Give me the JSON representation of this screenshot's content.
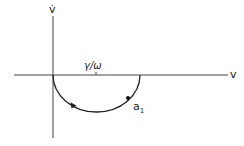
{
  "diagram": {
    "type": "phase-plane",
    "axes": {
      "x_label": "v",
      "y_label": "v̇"
    },
    "tick": {
      "label": "γ/ω"
    },
    "trajectory": {
      "shape": "semicircle below v-axis",
      "direction": "counterclockwise toward origin",
      "point_label_main": "a",
      "point_label_sub": "1"
    },
    "colors": {
      "stroke": "#222222",
      "background": "#ffffff"
    }
  }
}
